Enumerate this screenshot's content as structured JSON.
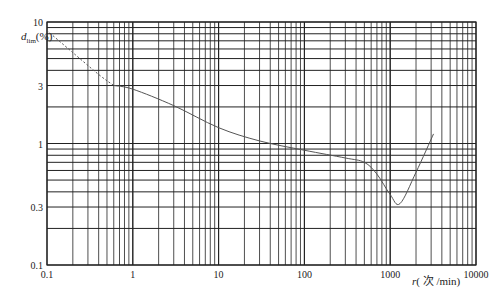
{
  "chart_data": {
    "type": "line",
    "title": "",
    "xlabel": "r(次/min)",
    "ylabel": "d_lim(%)",
    "xscale": "log",
    "yscale": "log",
    "xlim": [
      0.1,
      10000
    ],
    "ylim": [
      0.1,
      10
    ],
    "grid": true,
    "x_ticks": [
      "0.1",
      "1",
      "10",
      "100",
      "1000",
      "10000"
    ],
    "y_ticks": [
      "0.1",
      "0.3",
      "1",
      "3",
      "10"
    ],
    "series": [
      {
        "name": "extrapolated (dashed)",
        "style": "dashed",
        "x": [
          0.1,
          0.2,
          0.4,
          0.6
        ],
        "y": [
          8.5,
          5.6,
          3.7,
          3.0
        ]
      },
      {
        "name": "d_lim",
        "style": "solid",
        "x": [
          0.6,
          1,
          3,
          10,
          30,
          100,
          300,
          500,
          700,
          1000,
          1300,
          2000,
          3200
        ],
        "y": [
          3.0,
          2.8,
          2.05,
          1.35,
          1.05,
          0.88,
          0.76,
          0.7,
          0.56,
          0.38,
          0.32,
          0.58,
          1.2
        ]
      }
    ],
    "colors": {
      "grid": "#222222",
      "curve": "#555555",
      "background": "#ffffff"
    }
  },
  "axes": {
    "x_label_main": "r",
    "x_label_unit": "( 次 /min)",
    "y_label_main": "d",
    "y_label_sub": "lim",
    "y_label_unit": "(%)"
  }
}
